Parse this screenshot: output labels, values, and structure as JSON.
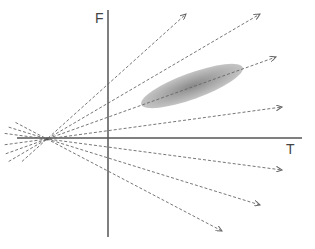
{
  "diagram": {
    "type": "ray-fan-diagram",
    "axes": {
      "x_label": "T",
      "y_label": "F",
      "color": "#555555",
      "horizontal": {
        "x1": 17,
        "y1": 138,
        "x2": 302,
        "y2": 138
      },
      "vertical": {
        "x1": 108,
        "y1": 10,
        "x2": 108,
        "y2": 237
      },
      "x_label_pos": {
        "x": 286,
        "y": 154
      },
      "y_label_pos": {
        "x": 95,
        "y": 23
      }
    },
    "origin_point": {
      "x": 47,
      "y": 139
    },
    "rays": {
      "color": "#666666",
      "dash": "3,2",
      "tail_length_ratio": 0.18,
      "endpoints": [
        {
          "x": 186,
          "y": 14
        },
        {
          "x": 260,
          "y": 14
        },
        {
          "x": 276,
          "y": 57
        },
        {
          "x": 282,
          "y": 107
        },
        {
          "x": 282,
          "y": 170
        },
        {
          "x": 260,
          "y": 205
        },
        {
          "x": 222,
          "y": 231
        }
      ]
    },
    "highlight_region": {
      "shape": "ellipse",
      "cx": 192,
      "cy": 86,
      "rx": 54,
      "ry": 13,
      "rotation_deg": -20,
      "color_center": "#8a8a8a",
      "color_edge": "#c4c4c4"
    }
  }
}
